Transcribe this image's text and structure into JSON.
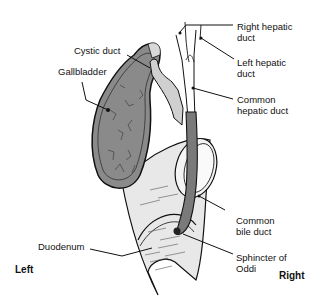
{
  "diagram": {
    "labels": {
      "right_hepatic_duct": "Right hepatic\nduct",
      "left_hepatic_duct": "Left hepatic\nduct",
      "cystic_duct": "Cystic duct",
      "gallbladder": "Gallbladder",
      "common_hepatic_duct": "Common\nhepatic duct",
      "common_bile_duct": "Common\nbile duct",
      "duodenum": "Duodenum",
      "sphincter_of_oddi": "Sphincter of\nOddi"
    },
    "orientation": {
      "left": "Left",
      "right": "Right"
    },
    "colors": {
      "gallbladder_fill": "#8a8a8a",
      "duct_fill": "#7a7a7a",
      "duodenum_fill": "#e6e6e6",
      "outline": "#111111",
      "background": "#ffffff"
    }
  }
}
